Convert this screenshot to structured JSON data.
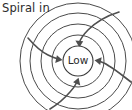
{
  "figure": {
    "title_label": "Spiral in",
    "center_label": "Low",
    "type": "weather-low-pressure-spiral-diagram",
    "colors": {
      "background": "#ffffff",
      "ring_stroke": "#4a4a4a",
      "arrow_stroke": "#4f4f4f",
      "text": "#2b2b2b"
    },
    "rings": [
      {
        "name": "core-circle",
        "cx": 78,
        "cy": 61,
        "r": 15
      },
      {
        "name": "ring-1",
        "cx": 78,
        "cy": 61,
        "r": 26
      },
      {
        "name": "ring-2",
        "cx": 78,
        "cy": 61,
        "r": 37
      },
      {
        "name": "ring-3",
        "cx": 78,
        "cy": 61,
        "r": 48
      },
      {
        "name": "ring-4",
        "cx": 78,
        "cy": 61,
        "r": 58
      }
    ],
    "arrows": [
      {
        "name": "arrow-top-right",
        "direction": "inward",
        "entry": "top-right",
        "points_to": "center"
      },
      {
        "name": "arrow-left",
        "direction": "inward",
        "entry": "upper-left",
        "points_to": "center"
      },
      {
        "name": "arrow-right",
        "direction": "inward",
        "entry": "lower-right",
        "points_to": "center"
      },
      {
        "name": "arrow-bottom",
        "direction": "inward",
        "entry": "bottom-left",
        "points_to": "center"
      }
    ]
  }
}
